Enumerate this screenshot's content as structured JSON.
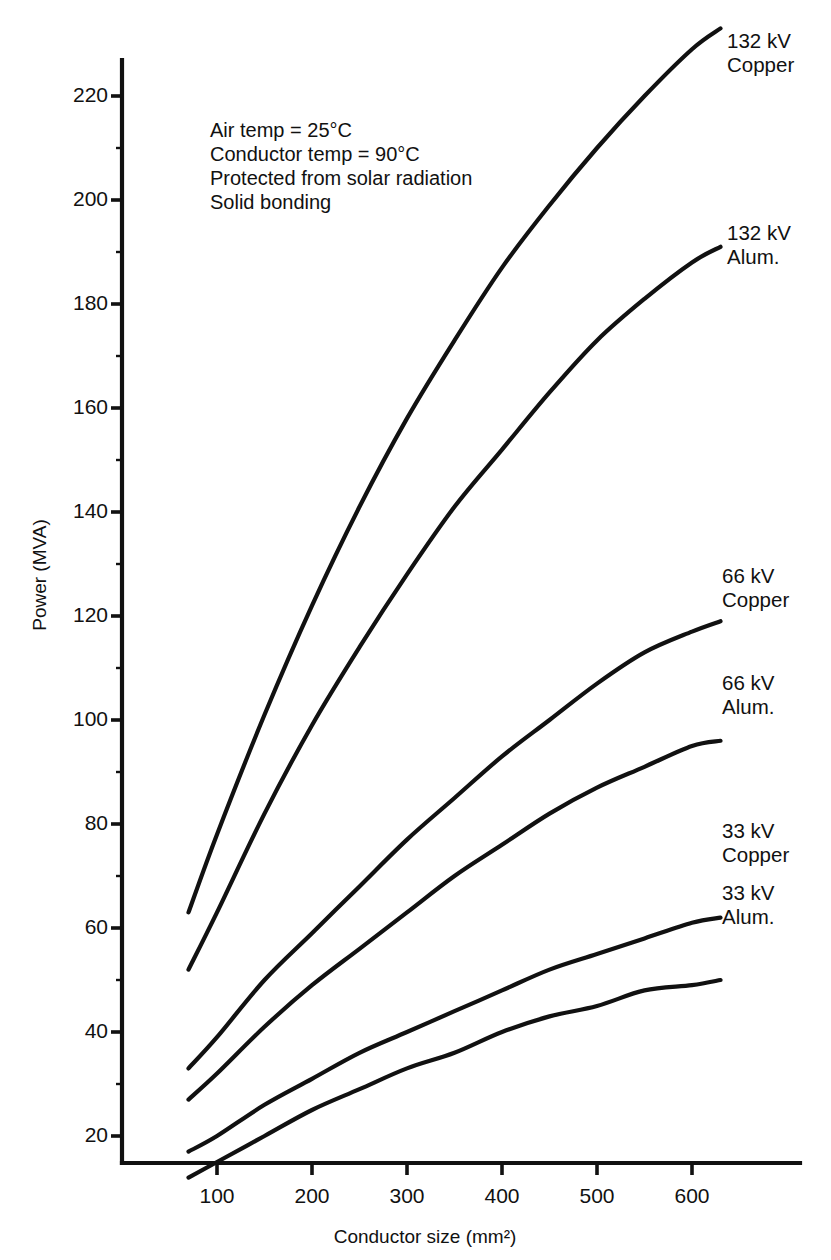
{
  "chart_data": {
    "type": "line",
    "title": "",
    "xlabel": "Conductor size (mm²)",
    "ylabel": "Power (MVA)",
    "xlim": [
      0,
      660
    ],
    "ylim": [
      0,
      240
    ],
    "xticks": [
      100,
      200,
      300,
      400,
      500,
      600
    ],
    "yticks": [
      20,
      40,
      60,
      80,
      100,
      120,
      140,
      160,
      180,
      200,
      220
    ],
    "xtick_labels": [
      "100",
      "200",
      "300",
      "400",
      "500",
      "600"
    ],
    "ytick_labels": [
      "20",
      "40",
      "60",
      "80",
      "100",
      "120",
      "140",
      "160",
      "180",
      "200",
      "220"
    ],
    "y_minor_step": 10,
    "grid": false,
    "legend_position": "right-inline-labels",
    "x": [
      70,
      100,
      150,
      200,
      250,
      300,
      350,
      400,
      450,
      500,
      550,
      600,
      630
    ],
    "series": [
      {
        "name": "132 kV Copper",
        "label_line1": "132 kV",
        "label_line2": "Copper",
        "values": [
          63,
          78,
          101,
          122,
          141,
          158,
          173,
          187,
          199,
          210,
          220,
          229,
          233
        ]
      },
      {
        "name": "132 kV Alum.",
        "label_line1": "132 kV",
        "label_line2": "Alum.",
        "values": [
          52,
          63,
          82,
          99,
          114,
          128,
          141,
          152,
          163,
          173,
          181,
          188,
          191
        ]
      },
      {
        "name": "66 kV Copper",
        "label_line1": "66 kV",
        "label_line2": "Copper",
        "values": [
          33,
          39,
          50,
          59,
          68,
          77,
          85,
          93,
          100,
          107,
          113,
          117,
          119
        ]
      },
      {
        "name": "66 kV Alum.",
        "label_line1": "66 kV",
        "label_line2": "Alum.",
        "values": [
          27,
          32,
          41,
          49,
          56,
          63,
          70,
          76,
          82,
          87,
          91,
          95,
          96
        ]
      },
      {
        "name": "33 kV Copper",
        "label_line1": "33 kV",
        "label_line2": "Copper",
        "values": [
          17,
          20,
          26,
          31,
          36,
          40,
          44,
          48,
          52,
          55,
          58,
          61,
          62
        ]
      },
      {
        "name": "33 kV Alum.",
        "label_line1": "33 kV",
        "label_line2": "Alum.",
        "values": [
          12,
          15,
          20,
          25,
          29,
          33,
          36,
          40,
          43,
          45,
          48,
          49,
          50
        ]
      }
    ],
    "annotations": [
      "Air temp  =  25°C",
      "Conductor temp  =  90°C",
      "Protected from solar radiation",
      "Solid bonding"
    ]
  },
  "axes": {
    "x_title": "Conductor size (mm²)",
    "y_title": "Power (MVA)"
  },
  "ytick_labels": {
    "t0": "20",
    "t1": "40",
    "t2": "60",
    "t3": "80",
    "t4": "100",
    "t5": "120",
    "t6": "140",
    "t7": "160",
    "t8": "180",
    "t9": "200",
    "t10": "220"
  },
  "xtick_labels": {
    "t0": "100",
    "t1": "200",
    "t2": "300",
    "t3": "400",
    "t4": "500",
    "t5": "600"
  },
  "notes": {
    "line0": "Air temp  =  25°C",
    "line1": "Conductor temp  =  90°C",
    "line2": "Protected from solar radiation",
    "line3": "Solid bonding"
  },
  "series_labels": {
    "s0a": "132 kV",
    "s0b": "Copper",
    "s1a": "132 kV",
    "s1b": "Alum.",
    "s2a": "66 kV",
    "s2b": "Copper",
    "s3a": "66 kV",
    "s3b": "Alum.",
    "s4a": "33 kV",
    "s4b": "Copper",
    "s5a": "33 kV",
    "s5b": "Alum."
  },
  "colors": {
    "ink": "#111111",
    "background": "#ffffff"
  }
}
